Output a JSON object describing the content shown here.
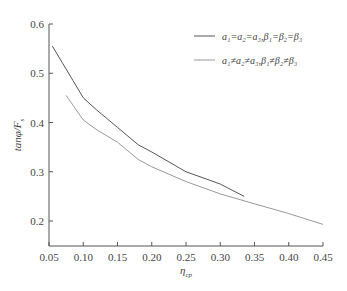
{
  "chart_data": {
    "type": "line",
    "title": "",
    "xlabel": "η_cp",
    "ylabel": "tanφ/F_s",
    "xlim": [
      0.05,
      0.45
    ],
    "ylim": [
      0.15,
      0.6
    ],
    "x_ticks": [
      "0.05",
      "0.10",
      "0.15",
      "0.20",
      "0.25",
      "0.30",
      "0.35",
      "0.40",
      "0.45"
    ],
    "y_ticks": [
      "0.2",
      "0.3",
      "0.4",
      "0.5",
      "0.6"
    ],
    "grid": false,
    "legend_position": "upper right",
    "series": [
      {
        "name": "a1=a2=a3,β1=β2=β3",
        "color": "#555555",
        "x": [
          0.055,
          0.07,
          0.085,
          0.1,
          0.12,
          0.15,
          0.18,
          0.2,
          0.25,
          0.28,
          0.3,
          0.335
        ],
        "y": [
          0.555,
          0.52,
          0.485,
          0.45,
          0.425,
          0.39,
          0.355,
          0.34,
          0.3,
          0.285,
          0.275,
          0.25
        ]
      },
      {
        "name": "a1≠a2≠a3,β1≠β2≠β3",
        "color": "#999999",
        "x": [
          0.075,
          0.085,
          0.1,
          0.12,
          0.15,
          0.18,
          0.2,
          0.25,
          0.3,
          0.35,
          0.4,
          0.45
        ],
        "y": [
          0.455,
          0.435,
          0.405,
          0.385,
          0.36,
          0.325,
          0.31,
          0.28,
          0.255,
          0.235,
          0.215,
          0.193
        ]
      }
    ]
  },
  "legend": {
    "entry1": "a₁=a₂=a₃,β₁=β₂=β₃",
    "entry2": "a₁≠a₂≠a₃,β₁≠β₂≠β₃"
  },
  "axes": {
    "x_label_main": "η",
    "x_label_sub": "cp",
    "y_label_main": "tanφ/F",
    "y_label_sub": "s"
  }
}
